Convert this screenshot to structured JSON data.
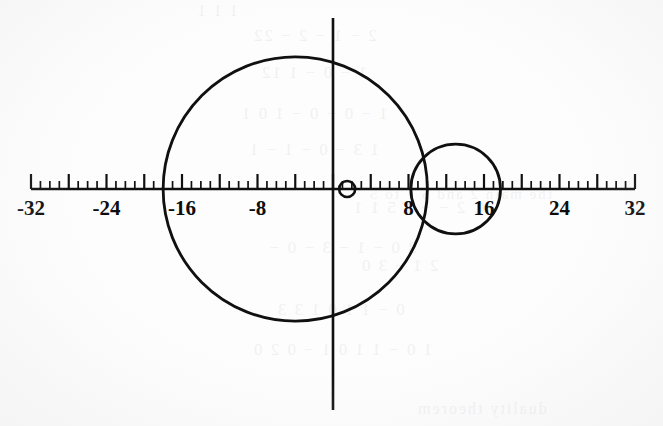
{
  "figure": {
    "title": "",
    "width": 663,
    "height": 426,
    "background_color": "#fdfdfd",
    "ink_color": "#101010"
  },
  "axes": {
    "x_axis": {
      "name": "horizontal-number-line",
      "min": -32,
      "max": 32,
      "pixel_min_x": 31,
      "pixel_max_x": 635,
      "pixel_y": 189,
      "major_tick_interval": 4,
      "minor_tick_interval": 1,
      "major_tick_length": 15,
      "minor_tick_length": 8,
      "line_width": 2.6
    },
    "y_axis": {
      "name": "vertical-axis",
      "pixel_x": 333,
      "pixel_top": 18,
      "pixel_bottom": 410,
      "line_width": 2.6
    },
    "labels": [
      {
        "text": "-32",
        "value": -32
      },
      {
        "text": "-24",
        "value": -24
      },
      {
        "text": "-16",
        "value": -16
      },
      {
        "text": "-8",
        "value": -8
      },
      {
        "text": "8",
        "value": 8
      },
      {
        "text": "16",
        "value": 16
      },
      {
        "text": "24",
        "value": 24
      },
      {
        "text": "32",
        "value": 32
      }
    ],
    "label_y_pixel": 198
  },
  "chart_data": {
    "type": "scatter",
    "title": "",
    "xlabel": "",
    "ylabel": "",
    "xlim": [
      -32,
      32
    ],
    "ylim": [
      -20,
      25
    ],
    "grid": false,
    "legend": "none",
    "annotations": [],
    "x_tick_values": [
      -32,
      -24,
      -16,
      -8,
      8,
      16,
      24,
      32
    ],
    "x_tick_labels": [
      "-32",
      "-24",
      "-16",
      "-8",
      "8",
      "16",
      "24",
      "32"
    ],
    "circles": [
      {
        "name": "large-circle",
        "center_x": -4.0,
        "center_y": 0.0,
        "radius": 14.0,
        "x_intercepts": [
          -18.0,
          10.0
        ],
        "stroke": "#101010",
        "stroke_width": 2.8,
        "fill": "none"
      },
      {
        "name": "medium-circle",
        "center_x": 13.0,
        "center_y": 0.0,
        "radius": 4.75,
        "x_intercepts": [
          8.25,
          17.75
        ],
        "stroke": "#101010",
        "stroke_width": 2.8,
        "fill": "none"
      },
      {
        "name": "small-circle",
        "center_x": 1.5,
        "center_y": 0.0,
        "radius": 0.85,
        "x_intercepts": [
          0.65,
          2.35
        ],
        "stroke": "#101010",
        "stroke_width": 2.6,
        "fill": "none"
      }
    ]
  },
  "bleed_through": {
    "note": "faint reversed text showing through from the opposite side of the page",
    "lines": [
      {
        "text": "1 1 1",
        "x": 196,
        "y": 2,
        "size": 16
      },
      {
        "text": "2 − 1 − 2 − 22",
        "x": 252,
        "y": 26,
        "size": 17
      },
      {
        "text": "1 − 0 − 1 12",
        "x": 260,
        "y": 63,
        "size": 17
      },
      {
        "text": "1 − 0 − 0 − 1 0 1",
        "x": 240,
        "y": 104,
        "size": 17
      },
      {
        "text": "1 3 − 0 − 1 − 1",
        "x": 248,
        "y": 140,
        "size": 17
      },
      {
        "text": "C 2 − − 1 5 1 1",
        "x": 352,
        "y": 198,
        "size": 17
      },
      {
        "text": "3 0 − 1 − 3 − 0 −",
        "x": 268,
        "y": 238,
        "size": 17
      },
      {
        "text": "2 1 − 3 0",
        "x": 360,
        "y": 256,
        "size": 17
      },
      {
        "text": "0 − 1 1 0 1 3 3",
        "x": 276,
        "y": 300,
        "size": 17
      },
      {
        "text": "1 0 − 1 1 0 1 − 0 2 0",
        "x": 252,
        "y": 340,
        "size": 17
      },
      {
        "text": "duality theorem",
        "x": 416,
        "y": 400,
        "size": 16
      },
      {
        "text": "the main 2 and 5 1 to 5",
        "x": 368,
        "y": 186,
        "size": 15
      }
    ]
  }
}
